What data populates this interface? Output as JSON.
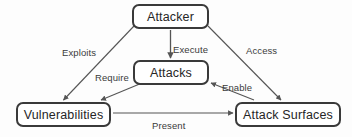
{
  "diagram": {
    "background_color": "#fdfdfd",
    "node_border_color": "#3a3a3a",
    "node_text_color": "#262626",
    "edge_color": "#555555",
    "label_text_color": "#3b3b3b",
    "nodes": [
      {
        "id": "attacker",
        "label": "Attacker"
      },
      {
        "id": "attacks",
        "label": "Attacks"
      },
      {
        "id": "vulnerabilities",
        "label": "Vulnerabilities"
      },
      {
        "id": "attack_surfaces",
        "label": "Attack Surfaces"
      }
    ],
    "edges": [
      {
        "id": "exploits",
        "label": "Exploits",
        "from": "attacker",
        "to": "vulnerabilities"
      },
      {
        "id": "execute",
        "label": "Execute",
        "from": "attacker",
        "to": "attacks"
      },
      {
        "id": "access",
        "label": "Access",
        "from": "attacker",
        "to": "attack_surfaces"
      },
      {
        "id": "require",
        "label": "Require",
        "from": "attacks",
        "to": "vulnerabilities"
      },
      {
        "id": "enable",
        "label": "Enable",
        "from": "attack_surfaces",
        "to": "attacks"
      },
      {
        "id": "present",
        "label": "Present",
        "from": "vulnerabilities",
        "to": "attack_surfaces"
      }
    ]
  }
}
